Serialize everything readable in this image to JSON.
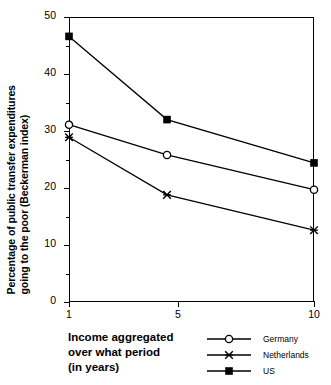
{
  "chart_data": {
    "type": "line",
    "title": "",
    "xlabel": "Income aggregated over what period (in years)",
    "ylabel": "Percentage of public transfer expenditures going to the poor (Beckerman index)",
    "xlim": [
      1,
      10
    ],
    "ylim": [
      0,
      50
    ],
    "grid": false,
    "legend_position": "bottom-right",
    "x": [
      1,
      4.6,
      10
    ],
    "xticks": [
      1,
      5,
      10
    ],
    "xtick_labels": [
      "1",
      "5",
      "10"
    ],
    "yticks": [
      0,
      10,
      20,
      30,
      40,
      50
    ],
    "ytick_labels": [
      "0",
      "10",
      "20",
      "30",
      "40",
      "50"
    ],
    "yticks_minor": [
      5,
      15,
      25,
      35,
      45
    ],
    "series": [
      {
        "name": "Germany",
        "marker": "open-circle",
        "values": [
          31.1,
          25.8,
          19.7
        ]
      },
      {
        "name": "Netherlands",
        "marker": "star",
        "values": [
          28.9,
          18.8,
          12.6
        ]
      },
      {
        "name": "US",
        "marker": "filled-square",
        "values": [
          46.6,
          32.0,
          24.4
        ]
      }
    ]
  },
  "axis": {
    "ylabel_line_1": "Percentage of public transfer expenditures",
    "ylabel_line_2": "going to the poor (Beckerman index)",
    "xlabel_line_1": "Income aggregated",
    "xlabel_line_2": "over what period",
    "xlabel_line_3": "(in years)"
  },
  "colors": {
    "ink": "#000000",
    "background": "#ffffff"
  }
}
